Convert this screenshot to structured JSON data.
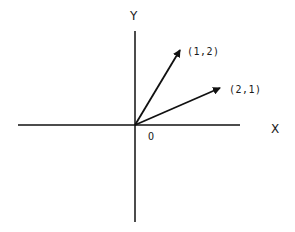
{
  "diagram": {
    "type": "vector-plot",
    "axes": {
      "x_label": "X",
      "y_label": "Y",
      "origin_label": "O",
      "color": "#111111"
    },
    "vectors": [
      {
        "label": "(1,2)",
        "x": 1,
        "y": 2
      },
      {
        "label": "(2,1)",
        "x": 2,
        "y": 1
      }
    ],
    "colors": {
      "background": "#ffffff",
      "ink": "#111111"
    }
  }
}
